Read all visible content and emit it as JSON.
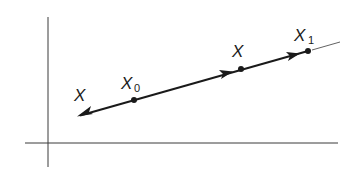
{
  "diagram": {
    "type": "vector line on coordinate axes",
    "colors": {
      "stroke": "#1a1a1a",
      "background": "#ffffff"
    },
    "axes": {
      "vertical": {
        "x": 48,
        "y1": 17,
        "y2": 167
      },
      "horizontal": {
        "y": 143,
        "x1": 25,
        "x2": 338
      }
    },
    "line": {
      "start": [
        78,
        116
      ],
      "end": [
        308,
        51
      ],
      "extension_end": [
        340,
        42
      ]
    },
    "points": [
      {
        "id": "x0",
        "label": "X",
        "subscript": "0",
        "at": [
          134,
          100
        ]
      },
      {
        "id": "x",
        "label": "X",
        "subscript": "",
        "at": [
          241,
          69
        ]
      },
      {
        "id": "x1",
        "label": "X",
        "subscript": "1",
        "at": [
          308,
          51
        ]
      }
    ],
    "labels": {
      "left_x": "X",
      "x0_main": "X",
      "x0_sub": "0",
      "mid_x": "X",
      "x1_main": "X",
      "x1_sub": "1"
    }
  }
}
